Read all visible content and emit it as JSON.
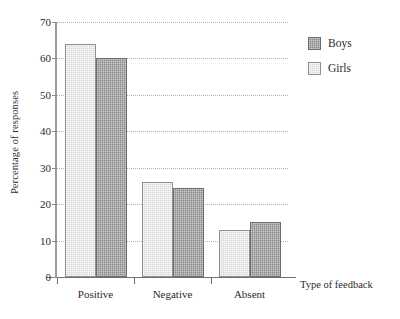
{
  "chart_data": {
    "type": "bar",
    "title": "",
    "xlabel": "Type of feedback",
    "ylabel": "Percentage of responses",
    "categories": [
      "Positive",
      "Negative",
      "Absent"
    ],
    "series": [
      {
        "name": "Girls",
        "values": [
          64,
          26,
          13
        ],
        "color": "#d8d8d8"
      },
      {
        "name": "Boys",
        "values": [
          60,
          24.5,
          15
        ],
        "color": "#8a8a8a"
      }
    ],
    "series_order_in_group": [
      "Girls",
      "Boys"
    ],
    "ylim": [
      0,
      70
    ],
    "ytick_labels": [
      "0",
      "10",
      "20",
      "30",
      "40",
      "50",
      "60",
      "70"
    ],
    "ytick_values": [
      0,
      10,
      20,
      30,
      40,
      50,
      60,
      70
    ],
    "grid": "horizontal-dotted",
    "legend_position": "top-right",
    "legend_entries": [
      "Boys",
      "Girls"
    ]
  }
}
